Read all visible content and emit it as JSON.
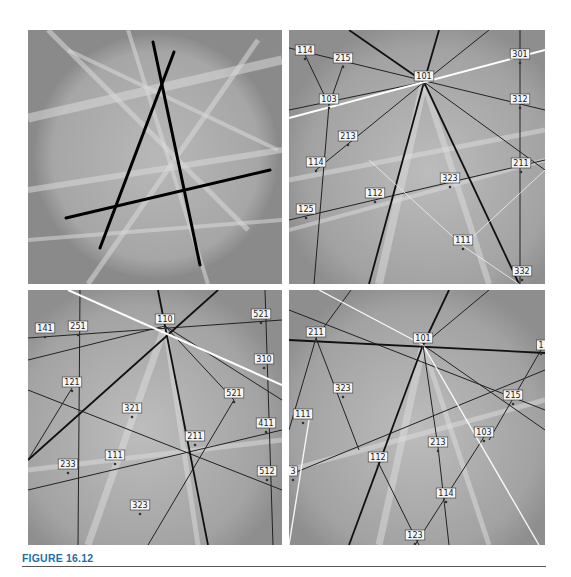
{
  "figure": {
    "caption": "FIGURE 16.12",
    "caption_color": "#1d6fa8",
    "background": "#8a8a8a"
  },
  "panels": [
    {
      "id": "a",
      "description": "Kikuchi pattern with three detected bands overlaid as black lines",
      "lines": [
        {
          "x1": 125,
          "y1": 12,
          "x2": 172,
          "y2": 235,
          "color": "#000000",
          "width": 3
        },
        {
          "x1": 146,
          "y1": 22,
          "x2": 72,
          "y2": 218,
          "color": "#000000",
          "width": 3
        },
        {
          "x1": 38,
          "y1": 188,
          "x2": 242,
          "y2": 140,
          "color": "#000000",
          "width": 3
        }
      ],
      "labels": []
    },
    {
      "id": "b",
      "description": "Indexed Kikuchi pattern",
      "labels": [
        {
          "text": "114",
          "x": 16,
          "y": 21
        },
        {
          "text": "215",
          "x": 54,
          "y": 29
        },
        {
          "text": "101",
          "x": 135,
          "y": 47
        },
        {
          "text": "301",
          "x": 231,
          "y": 25
        },
        {
          "text": "103",
          "x": 40,
          "y": 70
        },
        {
          "text": "312",
          "x": 231,
          "y": 70
        },
        {
          "text": "213",
          "x": 59,
          "y": 107
        },
        {
          "text": "114",
          "x": 27,
          "y": 133
        },
        {
          "text": "211",
          "x": 232,
          "y": 134
        },
        {
          "text": "323",
          "x": 161,
          "y": 149
        },
        {
          "text": "112",
          "x": 86,
          "y": 164
        },
        {
          "text": "125",
          "x": 17,
          "y": 180
        },
        {
          "text": "111",
          "x": 174,
          "y": 211
        },
        {
          "text": "332",
          "x": 233,
          "y": 242
        }
      ]
    },
    {
      "id": "c",
      "description": "Indexed Kikuchi pattern",
      "labels": [
        {
          "text": "141",
          "x": 17,
          "y": 39
        },
        {
          "text": "251",
          "x": 50,
          "y": 37
        },
        {
          "text": "110",
          "x": 137,
          "y": 30
        },
        {
          "text": "521",
          "x": 233,
          "y": 25
        },
        {
          "text": "310",
          "x": 236,
          "y": 70
        },
        {
          "text": "121",
          "x": 44,
          "y": 93
        },
        {
          "text": "321",
          "x": 104,
          "y": 119
        },
        {
          "text": "521",
          "x": 206,
          "y": 104
        },
        {
          "text": "211",
          "x": 167,
          "y": 147
        },
        {
          "text": "411",
          "x": 238,
          "y": 134
        },
        {
          "text": "233",
          "x": 40,
          "y": 175
        },
        {
          "text": "111",
          "x": 87,
          "y": 166
        },
        {
          "text": "512",
          "x": 239,
          "y": 182
        },
        {
          "text": "323",
          "x": 112,
          "y": 216
        }
      ]
    },
    {
      "id": "d",
      "description": "Indexed Kikuchi pattern",
      "labels": [
        {
          "text": "211",
          "x": 27,
          "y": 43
        },
        {
          "text": "101",
          "x": 134,
          "y": 49
        },
        {
          "text": "1",
          "x": 252,
          "y": 56
        },
        {
          "text": "323",
          "x": 54,
          "y": 99
        },
        {
          "text": "215",
          "x": 224,
          "y": 106
        },
        {
          "text": "111",
          "x": 14,
          "y": 125
        },
        {
          "text": "213",
          "x": 149,
          "y": 153
        },
        {
          "text": "103",
          "x": 195,
          "y": 143
        },
        {
          "text": "112",
          "x": 89,
          "y": 168
        },
        {
          "text": "3",
          "x": 4,
          "y": 182
        },
        {
          "text": "114",
          "x": 157,
          "y": 204
        },
        {
          "text": "123",
          "x": 126,
          "y": 246
        }
      ]
    }
  ]
}
